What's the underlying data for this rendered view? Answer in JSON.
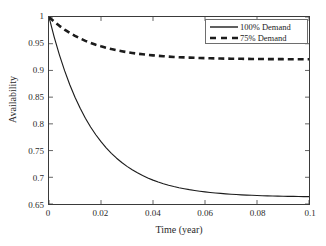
{
  "chart_data": {
    "type": "line",
    "title": "",
    "xlabel": "Time (year)",
    "ylabel": "Availability",
    "xlim": [
      0,
      0.1
    ],
    "ylim": [
      0.65,
      1
    ],
    "xticks": [
      "0",
      "0.02",
      "0.04",
      "0.06",
      "0.08",
      "0.1"
    ],
    "xtick_values": [
      0,
      0.02,
      0.04,
      0.06,
      0.08,
      0.1
    ],
    "yticks": [
      "1",
      "0.95",
      "0.9",
      "0.85",
      "0.8",
      "0.75",
      "0.7",
      "0.65"
    ],
    "ytick_values": [
      1,
      0.95,
      0.9,
      0.85,
      0.8,
      0.75,
      0.7,
      0.65
    ],
    "grid": false,
    "legend_position": "upper right",
    "x": [
      0,
      0.002,
      0.004,
      0.006,
      0.008,
      0.01,
      0.012,
      0.014,
      0.016,
      0.018,
      0.02,
      0.022,
      0.024,
      0.026,
      0.028,
      0.03,
      0.032,
      0.034,
      0.036,
      0.038,
      0.04,
      0.042,
      0.044,
      0.046,
      0.048,
      0.05,
      0.052,
      0.054,
      0.056,
      0.058,
      0.06,
      0.062,
      0.064,
      0.066,
      0.068,
      0.07,
      0.072,
      0.074,
      0.076,
      0.078,
      0.08,
      0.082,
      0.084,
      0.086,
      0.088,
      0.09,
      0.092,
      0.094,
      0.096,
      0.098,
      0.1
    ],
    "series": [
      {
        "name": "100% Demand",
        "style": "solid",
        "color": "#1c1c1c",
        "asymptote": 0.652,
        "values": [
          1.0,
          0.9625,
          0.9292,
          0.8996,
          0.8733,
          0.8499,
          0.8291,
          0.8106,
          0.7942,
          0.7796,
          0.7666,
          0.7551,
          0.7448,
          0.7357,
          0.7276,
          0.7204,
          0.714,
          0.7083,
          0.7032,
          0.6987,
          0.6947,
          0.6912,
          0.688,
          0.6852,
          0.6827,
          0.6805,
          0.6786,
          0.6768,
          0.6753,
          0.6739,
          0.6727,
          0.6716,
          0.6706,
          0.6698,
          0.669,
          0.6683,
          0.6677,
          0.6672,
          0.6667,
          0.6663,
          0.6659,
          0.6655,
          0.6652,
          0.665,
          0.6647,
          0.6645,
          0.6643,
          0.6642,
          0.664,
          0.6639,
          0.6638
        ]
      },
      {
        "name": "75% Demand",
        "style": "dashed",
        "color": "#1c1c1c",
        "asymptote": 0.921,
        "values": [
          1.0,
          0.9912,
          0.9834,
          0.9764,
          0.9702,
          0.9647,
          0.9598,
          0.9554,
          0.9516,
          0.9481,
          0.9451,
          0.9424,
          0.9399,
          0.9378,
          0.9359,
          0.9342,
          0.9327,
          0.9314,
          0.9302,
          0.9291,
          0.9282,
          0.9273,
          0.9266,
          0.9259,
          0.9253,
          0.9248,
          0.9244,
          0.924,
          0.9236,
          0.9233,
          0.923,
          0.9227,
          0.9225,
          0.9223,
          0.9221,
          0.922,
          0.9218,
          0.9217,
          0.9216,
          0.9215,
          0.9214,
          0.9213,
          0.9212,
          0.9212,
          0.9211,
          0.9211,
          0.921,
          0.921,
          0.921,
          0.9209,
          0.9209
        ]
      }
    ]
  },
  "axes": {
    "xlabel": "Time (year)",
    "ylabel": "Availability"
  },
  "legend": {
    "items": [
      {
        "label": "100% Demand",
        "style": "solid"
      },
      {
        "label": "75% Demand",
        "style": "dashed"
      }
    ]
  },
  "colors": {
    "line": "#1c1c1c",
    "axis": "#3a3a3a",
    "text": "#2b2b2b",
    "background": "#ffffff"
  }
}
